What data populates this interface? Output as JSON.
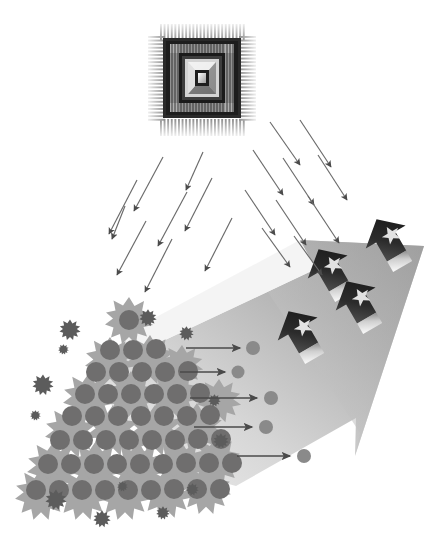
{
  "canvas": {
    "width": 446,
    "height": 547,
    "background": "#ffffff"
  },
  "title": "Microprocessor distributing pellets onto a pyramid stack and a large advancing arrow",
  "palette": {
    "white": "#ffffff",
    "chip_light": "#d6d6d6",
    "chip_mid": "#9a9a9a",
    "chip_dark": "#3a3a3a",
    "chip_black": "#1c1c1c",
    "splat_gray": "#a6a6a6",
    "dot_gray": "#6f6e6e",
    "small_splat_dark": "#5c5c5c",
    "big_arrow_light": "#e4e4e4",
    "big_arrow_mid": "#bdbdbd",
    "big_arrow_dark": "#9d9d9d",
    "small_arrow_dark": "#2e2e2e",
    "small_arrow_mid": "#6a6a6a",
    "small_arrow_light": "#f0f0f0",
    "star_fill": "#dcdcdc",
    "thin_arrow": "#555555",
    "pointer_arrow": "#4a4a4a"
  },
  "elements": {
    "chip": {
      "name": "microprocessor-chip",
      "x": 148,
      "y": 24,
      "width": 108,
      "height": 112,
      "pin_count_per_side": 26,
      "layers": [
        "outer-pins",
        "package-body",
        "inner-ring",
        "die",
        "core-square"
      ]
    },
    "arrow_spray_left": {
      "name": "particle-arrows-left",
      "count": 9,
      "direction": "down-left",
      "arrows": [
        {
          "x1": 163,
          "y1": 157,
          "x2": 131,
          "y2": 216
        },
        {
          "x1": 137,
          "y1": 180,
          "x2": 106,
          "y2": 239
        },
        {
          "x1": 187,
          "y1": 192,
          "x2": 155,
          "y2": 251
        },
        {
          "x1": 212,
          "y1": 178,
          "x2": 182,
          "y2": 236
        },
        {
          "x1": 146,
          "y1": 221,
          "x2": 114,
          "y2": 280
        },
        {
          "x1": 172,
          "y1": 239,
          "x2": 142,
          "y2": 297
        },
        {
          "x1": 232,
          "y1": 218,
          "x2": 202,
          "y2": 276
        },
        {
          "x1": 201,
          "y1": 158,
          "x2": 183,
          "y2": 195
        },
        {
          "x1": 124,
          "y1": 208,
          "x2": 110,
          "y2": 244
        }
      ]
    },
    "arrow_spray_right": {
      "name": "particle-arrows-right",
      "count": 10,
      "direction": "down-right",
      "arrows": [
        {
          "x1": 270,
          "y1": 122,
          "x2": 303,
          "y2": 170
        },
        {
          "x1": 300,
          "y1": 120,
          "x2": 334,
          "y2": 172
        },
        {
          "x1": 253,
          "y1": 150,
          "x2": 286,
          "y2": 200
        },
        {
          "x1": 283,
          "y1": 158,
          "x2": 317,
          "y2": 210
        },
        {
          "x1": 318,
          "y1": 155,
          "x2": 350,
          "y2": 205
        },
        {
          "x1": 245,
          "y1": 190,
          "x2": 278,
          "y2": 240
        },
        {
          "x1": 276,
          "y1": 200,
          "x2": 309,
          "y2": 250
        },
        {
          "x1": 308,
          "y1": 196,
          "x2": 342,
          "y2": 248
        },
        {
          "x1": 262,
          "y1": 228,
          "x2": 293,
          "y2": 272
        },
        {
          "x1": 294,
          "y1": 236,
          "x2": 325,
          "y2": 280
        }
      ]
    },
    "big_arrow": {
      "name": "large-gray-arrow",
      "direction": "up-right",
      "tip": {
        "x": 424,
        "y": 246
      },
      "gradient_from": "#e8e8e8",
      "gradient_to": "#a4a4a4"
    },
    "small_star_arrows": {
      "name": "star-arrow-badges",
      "count": 4,
      "positions": [
        {
          "x": 310,
          "y": 280,
          "size": 56
        },
        {
          "x": 368,
          "y": 250,
          "size": 56
        },
        {
          "x": 280,
          "y": 340,
          "size": 56
        },
        {
          "x": 338,
          "y": 312,
          "size": 56
        }
      ],
      "glyph": "star"
    },
    "pointer_arrows": {
      "name": "pointer-arrows-to-dots",
      "count": 5,
      "rows": [
        {
          "x1": 186,
          "y1": 348,
          "x2": 243,
          "y2": 348,
          "dot_x": 253,
          "dot_y": 348,
          "dot_r": 7
        },
        {
          "x1": 180,
          "y1": 372,
          "x2": 228,
          "y2": 372,
          "dot_x": 238,
          "dot_y": 372,
          "dot_r": 6
        },
        {
          "x1": 190,
          "y1": 398,
          "x2": 260,
          "y2": 398,
          "dot_x": 271,
          "dot_y": 398,
          "dot_r": 7
        },
        {
          "x1": 194,
          "y1": 427,
          "x2": 255,
          "y2": 427,
          "dot_x": 266,
          "dot_y": 427,
          "dot_r": 7
        },
        {
          "x1": 237,
          "y1": 456,
          "x2": 293,
          "y2": 456,
          "dot_x": 304,
          "dot_y": 456,
          "dot_r": 7
        }
      ]
    },
    "pyramid": {
      "name": "pellet-pyramid",
      "apex": {
        "x": 128,
        "y": 303
      },
      "base_left": {
        "x": 22,
        "y": 512
      },
      "base_right": {
        "x": 232,
        "y": 512
      },
      "dot_rows": [
        1,
        3,
        5,
        6,
        8,
        9,
        10,
        11
      ],
      "dot_radius": 9,
      "splat_count": 22,
      "small_splat_count": 13
    },
    "scatter_splats": {
      "name": "scattered-splats",
      "items": [
        {
          "x": 70,
          "y": 330,
          "s": 11
        },
        {
          "x": 63,
          "y": 349,
          "s": 5
        },
        {
          "x": 148,
          "y": 318,
          "s": 9
        },
        {
          "x": 186,
          "y": 333,
          "s": 7
        },
        {
          "x": 43,
          "y": 385,
          "s": 11
        },
        {
          "x": 35,
          "y": 415,
          "s": 5
        },
        {
          "x": 214,
          "y": 400,
          "s": 6
        },
        {
          "x": 220,
          "y": 440,
          "s": 8
        },
        {
          "x": 56,
          "y": 500,
          "s": 11
        },
        {
          "x": 102,
          "y": 519,
          "s": 9
        },
        {
          "x": 163,
          "y": 513,
          "s": 7
        },
        {
          "x": 193,
          "y": 490,
          "s": 6
        },
        {
          "x": 123,
          "y": 487,
          "s": 5
        }
      ]
    }
  }
}
